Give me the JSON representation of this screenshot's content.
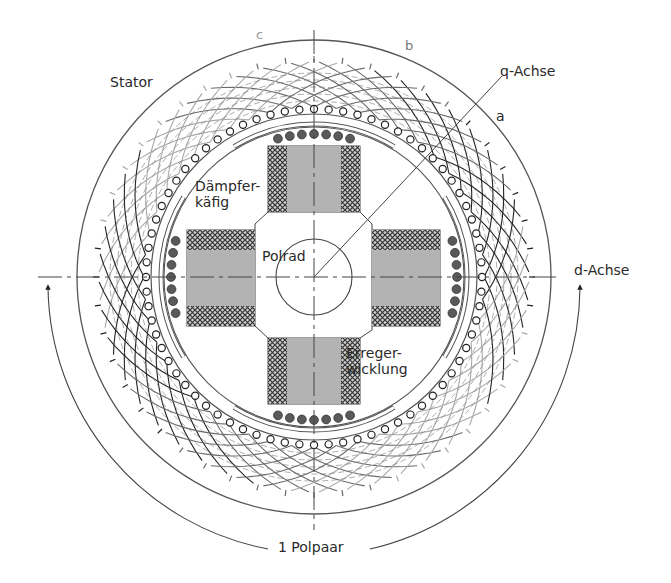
{
  "diagram": {
    "type": "synchronous-machine-cross-section",
    "colors": {
      "background": "#ffffff",
      "line": "#444444",
      "winding_dark": "#222222",
      "winding_mid": "#6a6a6a",
      "winding_light": "#a8a8a8",
      "pole_fill": "#b3b3b3",
      "field_winding_hatch": "#3a3a3a",
      "damper_bar": "#5a5a5a",
      "phase_label_light": "#8a8a8a"
    },
    "labels": {
      "stator": "Stator",
      "phase_c": "c",
      "phase_b": "b",
      "phase_a": "a",
      "q_axis": "q-Achse",
      "d_axis": "d-Achse",
      "damper_cage": "Dämpfer-\nkäfig",
      "rotor": "Polrad",
      "field_winding": "Erreger-\nwicklung",
      "pole_pair": "1 Polpaar"
    },
    "geometry": {
      "center": [
        314,
        277
      ],
      "outer_stator_radius": 237,
      "winding_outer_radius": 215,
      "stator_bore_radius": 168,
      "airgap_radius": 156,
      "damper_radius": 158,
      "hub_radius": 38,
      "q_axis_angle_deg": 45,
      "pole_pair_arc_radius": 272
    }
  }
}
